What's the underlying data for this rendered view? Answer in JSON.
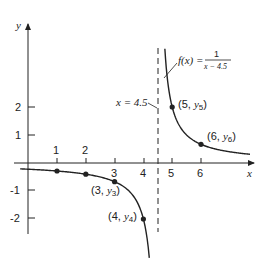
{
  "figure": {
    "function_label": {
      "lhs": "f(x) = ",
      "numerator": "1",
      "denominator": "x − 4.5"
    },
    "asymptote_label": "x = 4.5",
    "axis_labels": {
      "x": "x",
      "y": "y"
    },
    "colors": {
      "ink": "#222222",
      "background": "#ffffff"
    }
  },
  "chart_data": {
    "type": "line",
    "title": "",
    "function": "f(x) = 1/(x - 4.5)",
    "xlabel": "x",
    "ylabel": "y",
    "asymptote": {
      "x": 4.5,
      "style": "dashed",
      "label": "x = 4.5"
    },
    "xlim": [
      -0.3,
      7.8
    ],
    "ylim": [
      -3.4,
      4.9
    ],
    "x_ticks": [
      1,
      2,
      3,
      4,
      5,
      6
    ],
    "y_ticks": [
      -2,
      -1,
      1,
      2
    ],
    "grid": false,
    "labeled_points": [
      {
        "x": 1,
        "y": -0.2857,
        "label": ""
      },
      {
        "x": 2,
        "y": -0.4,
        "label": ""
      },
      {
        "x": 3,
        "y": -0.6667,
        "label": "(3, y3)"
      },
      {
        "x": 4,
        "y": -2,
        "label": "(4, y4)"
      },
      {
        "x": 5,
        "y": 2,
        "label": "(5, y5)"
      },
      {
        "x": 6,
        "y": 0.6667,
        "label": "(6, y6)"
      }
    ]
  }
}
